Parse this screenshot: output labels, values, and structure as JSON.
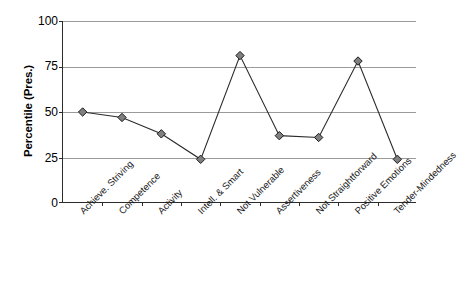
{
  "chart_data": {
    "type": "line",
    "title": "",
    "xlabel": "",
    "ylabel": "Percentile (Pres.)",
    "ylim": [
      0,
      100
    ],
    "yticks": [
      0,
      25,
      50,
      75,
      100
    ],
    "grid": true,
    "legend": "none",
    "marker": "diamond",
    "categories": [
      "Achieve. Striving",
      "Competence",
      "Activity",
      "Intell. & Smart",
      "Not Vulnerable",
      "Assertiveness",
      "Not Straightforward",
      "Positive Emotions",
      "Tender-Mindedness"
    ],
    "values": [
      50,
      47,
      38,
      24,
      81,
      37,
      36,
      78,
      24
    ],
    "series": [
      {
        "name": "Percentile (Pres.)",
        "values": [
          50,
          47,
          38,
          24,
          81,
          37,
          36,
          78,
          24
        ]
      }
    ]
  },
  "axes": {
    "y_title": "Percentile (Pres.)",
    "y_tick_labels": [
      "100",
      "75",
      "50",
      "25",
      "0"
    ]
  },
  "colors": {
    "line": "#2b2b2b",
    "marker_fill": "#808080",
    "marker_stroke": "#1a1a1a",
    "gridline": "#9a9a9a",
    "axis": "#2b2b2b",
    "background": "#ffffff"
  }
}
